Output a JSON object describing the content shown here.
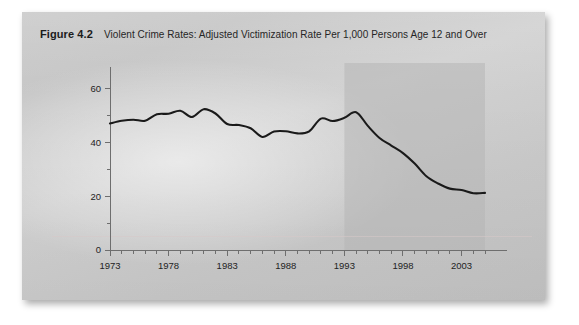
{
  "figure": {
    "number": "Figure 4.2",
    "title": "Violent Crime Rates: Adjusted Victimization Rate Per 1,000 Persons Age 12 and Over"
  },
  "colors": {
    "card_background": "#c9c9c9",
    "line": "#1a1a1a",
    "axis": "#6e6e6e",
    "highlight_band": "#b4b4b4",
    "text": "#232323"
  },
  "chart_data": {
    "type": "line",
    "title": "Violent Crime Rates: Adjusted Victimization Rate Per 1,000 Persons Age 12 and Over",
    "xlabel": "",
    "ylabel": "",
    "xlim": [
      1973,
      2005
    ],
    "ylim": [
      0,
      65
    ],
    "yticks": [
      0,
      20,
      40,
      60
    ],
    "ytick_labels": [
      "0",
      "20",
      "40",
      "60"
    ],
    "yticks_minor": [
      10,
      30,
      50
    ],
    "xticks": [
      1973,
      1978,
      1983,
      1988,
      1993,
      1998,
      2003
    ],
    "xtick_labels": [
      "1973",
      "1978",
      "1983",
      "1988",
      "1993",
      "1998",
      "2003"
    ],
    "xticks_minor_every": 1,
    "grid": false,
    "legend": "none",
    "highlight_band": {
      "x_start": 1993,
      "x_end": 2005,
      "label": ""
    },
    "series": [
      {
        "name": "Adjusted victimization rate per 1,000 persons age 12 and over",
        "x": [
          1973,
          1974,
          1975,
          1976,
          1977,
          1978,
          1979,
          1980,
          1981,
          1982,
          1983,
          1984,
          1985,
          1986,
          1987,
          1988,
          1989,
          1990,
          1991,
          1992,
          1993,
          1994,
          1995,
          1996,
          1997,
          1998,
          1999,
          2000,
          2001,
          2002,
          2003,
          2004,
          2005
        ],
        "values": [
          47.0,
          48.0,
          48.4,
          48.0,
          50.4,
          50.6,
          51.7,
          49.4,
          52.3,
          50.7,
          46.8,
          46.4,
          45.2,
          42.0,
          44.0,
          44.1,
          43.3,
          44.1,
          48.8,
          47.9,
          49.1,
          51.2,
          46.1,
          41.6,
          38.8,
          36.0,
          32.1,
          27.4,
          24.7,
          22.8,
          22.3,
          21.1,
          21.2
        ]
      }
    ]
  }
}
